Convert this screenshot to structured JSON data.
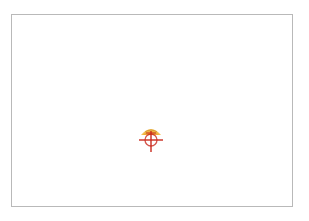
{
  "canvas": {
    "background": "#ffffff",
    "border_color": "#b9b9b9"
  },
  "marker": {
    "icon": "crosshair-dome-icon",
    "colors": {
      "dome": "#f2b533",
      "dome_shadow": "#c8892a",
      "cross": "#c92a1e"
    }
  }
}
